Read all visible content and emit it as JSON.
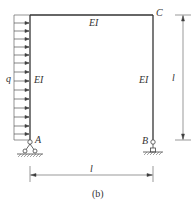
{
  "figure": {
    "caption": "(b)",
    "load_label": "q",
    "members": {
      "beam_label": "EI",
      "left_column_label": "EI",
      "right_column_label": "EI"
    },
    "nodes": {
      "A": "A",
      "B": "B",
      "C": "C"
    },
    "dimensions": {
      "height_label": "l",
      "span_label": "l"
    },
    "colors": {
      "frame": "#333333",
      "load": "#555555",
      "dimension": "#555555"
    }
  }
}
